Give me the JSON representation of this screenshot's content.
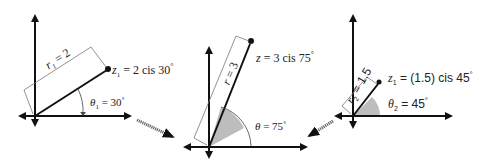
{
  "diagram": {
    "panels": [
      {
        "id": "z1",
        "vector_label": "z",
        "vector_sub": "1",
        "vector_value": " = 2 cis 30",
        "radius_label": "r",
        "radius_sub": "1",
        "radius_value": " = 2",
        "angle_label": "θ",
        "angle_sub": "1",
        "angle_value": " = 30",
        "degree": "°"
      },
      {
        "id": "z",
        "vector_label": "z",
        "vector_value": " = 3 cis 75",
        "radius_label": "r",
        "radius_value": " = 3",
        "angle_label": "θ",
        "angle_value": " = 75",
        "degree": "°"
      },
      {
        "id": "z2",
        "vector_label": "z",
        "vector_sub": "1",
        "vector_value": " = (1.5) cis 45",
        "radius_label": "r",
        "radius_sub": "2",
        "radius_value": " = 1.5",
        "angle_label": "θ",
        "angle_sub": "2",
        "angle_value": " = 45",
        "degree": "°"
      }
    ],
    "colors": {
      "axis": "#111111",
      "vector": "#111111",
      "dimension_line": "#777777",
      "angle_fill": "#bdbdbd",
      "arrow": "#555555"
    }
  }
}
